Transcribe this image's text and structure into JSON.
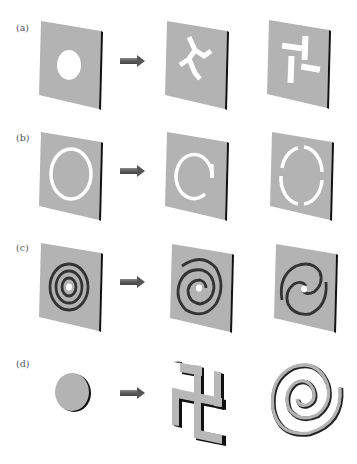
{
  "figure": {
    "rows": [
      {
        "label": "(a)",
        "description": "Plate with circular hole transformed into plates with three-armed and pinwheel slot apertures"
      },
      {
        "label": "(b)",
        "description": "Plate with full annular ring slot transformed into split-ring and four-segment ring slots"
      },
      {
        "label": "(c)",
        "description": "Plate with concentric ring grooves transformed into spiral groove patterns"
      },
      {
        "label": "(d)",
        "description": "Solid disk particle transformed into swastika-shaped and spiral-shaped particles"
      }
    ],
    "arrow_color": "#5e5e5e",
    "plate_color": "#b3b3b3",
    "plate_edge_color": "#111111",
    "aperture_color": "#ffffff"
  }
}
